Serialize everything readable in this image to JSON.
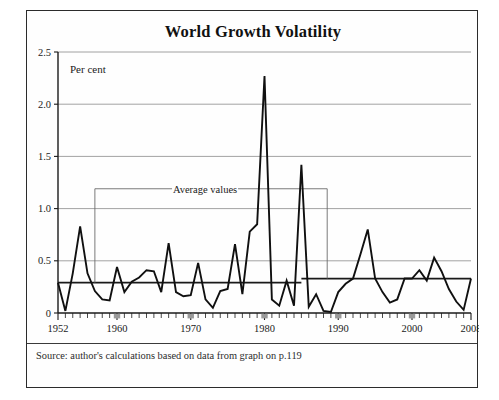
{
  "figure": {
    "title": "World Growth Volatility",
    "source": "Source:  author's calculations based on data from graph on p.119",
    "unit_label": "Per cent",
    "annotation_label": "Average values"
  },
  "chart_data": {
    "type": "line",
    "title": "World Growth Volatility",
    "xlabel": "",
    "ylabel": "Per cent",
    "ylim": [
      0,
      2.5
    ],
    "xlim": [
      1952,
      2008
    ],
    "grid": true,
    "legend": false,
    "yticks": [
      "0",
      "0.5",
      "1.0",
      "1.5",
      "2.0",
      "2.5"
    ],
    "ytick_values": [
      0,
      0.5,
      1.0,
      1.5,
      2.0,
      2.5
    ],
    "xticks": [
      "1952",
      "1960",
      "1970",
      "1980",
      "1990",
      "2000",
      "2008"
    ],
    "xtick_values": [
      1952,
      1960,
      1970,
      1980,
      1990,
      2000,
      2008
    ],
    "x": [
      1952,
      1953,
      1954,
      1955,
      1956,
      1957,
      1958,
      1959,
      1960,
      1961,
      1962,
      1963,
      1964,
      1965,
      1966,
      1967,
      1968,
      1969,
      1970,
      1971,
      1972,
      1973,
      1974,
      1975,
      1976,
      1977,
      1978,
      1979,
      1980,
      1981,
      1982,
      1983,
      1984,
      1985,
      1986,
      1987,
      1988,
      1989,
      1990,
      1991,
      1992,
      1993,
      1994,
      1995,
      1996,
      1997,
      1998,
      1999,
      2000,
      2001,
      2002,
      2003,
      2004,
      2005,
      2006,
      2007,
      2008
    ],
    "values": [
      0.29,
      0.02,
      0.38,
      0.83,
      0.38,
      0.21,
      0.13,
      0.12,
      0.44,
      0.2,
      0.3,
      0.34,
      0.41,
      0.4,
      0.2,
      0.67,
      0.2,
      0.16,
      0.17,
      0.48,
      0.13,
      0.05,
      0.21,
      0.23,
      0.66,
      0.18,
      0.78,
      0.85,
      2.27,
      0.13,
      0.07,
      0.31,
      0.07,
      1.42,
      0.06,
      0.18,
      0.02,
      0.01,
      0.2,
      0.28,
      0.33,
      0.56,
      0.8,
      0.33,
      0.2,
      0.1,
      0.13,
      0.33,
      0.33,
      0.41,
      0.31,
      0.53,
      0.4,
      0.23,
      0.11,
      0.03,
      0.33
    ],
    "series": [
      {
        "name": "World growth volatility",
        "values": [
          0.29,
          0.02,
          0.38,
          0.83,
          0.38,
          0.21,
          0.13,
          0.12,
          0.44,
          0.2,
          0.3,
          0.34,
          0.41,
          0.4,
          0.2,
          0.67,
          0.2,
          0.16,
          0.17,
          0.48,
          0.13,
          0.05,
          0.21,
          0.23,
          0.66,
          0.18,
          0.78,
          0.85,
          2.27,
          0.13,
          0.07,
          0.31,
          0.07,
          1.42,
          0.06,
          0.18,
          0.02,
          0.01,
          0.2,
          0.28,
          0.33,
          0.56,
          0.8,
          0.33,
          0.2,
          0.1,
          0.13,
          0.33,
          0.33,
          0.41,
          0.31,
          0.53,
          0.4,
          0.23,
          0.11,
          0.03,
          0.33
        ]
      }
    ],
    "average_lines": [
      {
        "label": "Average values",
        "x_start": 1952,
        "x_end": 1985,
        "value": 0.29
      },
      {
        "label": "Average values",
        "x_start": 1985,
        "x_end": 2008,
        "value": 0.33
      }
    ],
    "annotations": [
      {
        "text": "Per cent",
        "x": 1954,
        "y": 2.33
      },
      {
        "text": "Average values",
        "x": 1974,
        "y": 1.19
      }
    ],
    "highlighted_xticks": [
      1960,
      1970,
      1980,
      1990,
      2000
    ]
  }
}
